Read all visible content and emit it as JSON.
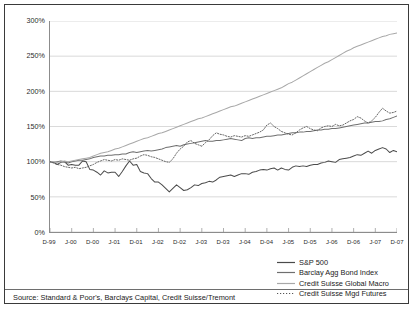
{
  "source_note": "Source: Standard & Poor's, Barclays Capital, Credit Suisse/Tremont",
  "legend": {
    "position": "bottom-right",
    "entries": [
      {
        "label": "S&P 500",
        "style": "solid",
        "color": "#4a4a4a"
      },
      {
        "label": "Barclay Agg Bond Index",
        "style": "solid",
        "color": "#6f6f6f"
      },
      {
        "label": "Credit Suisse Global Macro",
        "style": "solid",
        "color": "#a8a8a8"
      },
      {
        "label": "Credit Suisse Mgd Futures",
        "style": "dash-dot",
        "color": "#555555"
      }
    ]
  },
  "chart_data": {
    "type": "line",
    "title": "",
    "subtitle": "",
    "xlabel": "",
    "ylabel": "",
    "grid": "horizontal",
    "legend_position": "bottom-right",
    "ylim": [
      0,
      300
    ],
    "yticks": [
      0,
      50,
      100,
      150,
      200,
      250,
      300
    ],
    "ytick_labels": [
      "0%",
      "50%",
      "100%",
      "150%",
      "200%",
      "250%",
      "300%"
    ],
    "xtick_labels": [
      "D-99",
      "J-00",
      "D-00",
      "J-01",
      "D-01",
      "J-02",
      "D-02",
      "J-03",
      "D-03",
      "J-04",
      "D-04",
      "J-05",
      "D-05",
      "J-06",
      "D-06",
      "J-07",
      "D-07"
    ],
    "x_start": "D-99",
    "x_end": "D-07",
    "x_count": 97,
    "series": [
      {
        "name": "S&P 500",
        "color": "#4a4a4a",
        "style": "solid",
        "values": [
          100,
          99,
          96,
          99,
          100,
          95,
          96,
          95,
          95,
          101,
          100,
          89,
          88,
          85,
          81,
          87,
          84,
          85,
          85,
          79,
          86,
          94,
          101,
          95,
          96,
          86,
          84,
          83,
          76,
          71,
          71,
          67,
          62,
          57,
          62,
          67,
          63,
          59,
          60,
          63,
          67,
          66,
          69,
          70,
          72,
          71,
          74,
          78,
          79,
          80,
          81,
          79,
          81,
          83,
          83,
          82,
          85,
          86,
          88,
          89,
          88,
          90,
          91,
          88,
          91,
          89,
          88,
          92,
          94,
          93,
          94,
          93,
          95,
          96,
          96,
          98,
          99,
          101,
          100,
          99,
          103,
          104,
          105,
          106,
          108,
          110,
          109,
          112,
          115,
          112,
          116,
          118,
          120,
          118,
          113,
          116,
          114
        ]
      },
      {
        "name": "Barclay Agg Bond Index",
        "color": "#6f6f6f",
        "style": "solid",
        "values": [
          100,
          99,
          100,
          101,
          100,
          98,
          100,
          101,
          102,
          102,
          103,
          104,
          106,
          107,
          108,
          108,
          109,
          109,
          110,
          110,
          111,
          111,
          113,
          114,
          113,
          114,
          115,
          116,
          115,
          116,
          117,
          118,
          120,
          121,
          122,
          123,
          122,
          124,
          125,
          126,
          127,
          128,
          129,
          130,
          129,
          129,
          130,
          130,
          131,
          132,
          133,
          132,
          131,
          130,
          133,
          134,
          133,
          134,
          134,
          135,
          136,
          136,
          137,
          138,
          138,
          139,
          140,
          141,
          141,
          142,
          142,
          143,
          143,
          144,
          145,
          145,
          146,
          146,
          147,
          147,
          148,
          149,
          150,
          151,
          152,
          153,
          154,
          155,
          155,
          156,
          157,
          157,
          158,
          160,
          161,
          163,
          165
        ]
      },
      {
        "name": "Credit Suisse Global Macro",
        "color": "#a8a8a8",
        "style": "solid",
        "values": [
          100,
          100,
          99,
          100,
          101,
          100,
          101,
          102,
          103,
          104,
          105,
          106,
          108,
          110,
          112,
          113,
          114,
          116,
          118,
          119,
          121,
          123,
          125,
          127,
          129,
          131,
          133,
          134,
          136,
          138,
          140,
          141,
          143,
          145,
          147,
          149,
          151,
          153,
          155,
          157,
          159,
          161,
          162,
          164,
          166,
          168,
          170,
          172,
          174,
          176,
          178,
          179,
          181,
          183,
          185,
          187,
          189,
          191,
          193,
          195,
          197,
          199,
          201,
          203,
          205,
          208,
          211,
          213,
          216,
          219,
          222,
          225,
          228,
          231,
          234,
          237,
          240,
          242,
          245,
          248,
          251,
          254,
          257,
          259,
          262,
          264,
          266,
          268,
          270,
          272,
          274,
          276,
          278,
          279,
          281,
          282,
          283
        ]
      },
      {
        "name": "Credit Suisse Mgd Futures",
        "color": "#555555",
        "style": "dash-dot",
        "values": [
          100,
          98,
          96,
          95,
          93,
          92,
          91,
          92,
          90,
          91,
          92,
          94,
          96,
          99,
          101,
          103,
          102,
          101,
          103,
          102,
          104,
          103,
          102,
          104,
          105,
          108,
          110,
          109,
          107,
          106,
          104,
          102,
          100,
          99,
          104,
          112,
          118,
          122,
          128,
          130,
          126,
          124,
          122,
          127,
          131,
          137,
          141,
          139,
          138,
          136,
          135,
          137,
          136,
          135,
          137,
          136,
          138,
          140,
          142,
          145,
          152,
          155,
          150,
          147,
          143,
          141,
          139,
          138,
          141,
          145,
          148,
          150,
          147,
          145,
          144,
          148,
          150,
          151,
          150,
          153,
          151,
          152,
          155,
          158,
          160,
          164,
          162,
          158,
          155,
          158,
          163,
          170,
          176,
          172,
          169,
          170,
          172
        ]
      }
    ]
  }
}
